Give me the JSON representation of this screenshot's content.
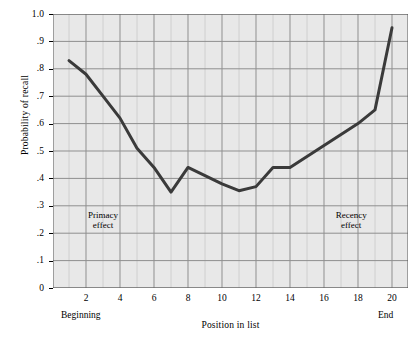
{
  "chart_data": {
    "type": "line",
    "title": "",
    "xlabel": "Position in list",
    "ylabel": "Probability of recall",
    "x": [
      1,
      2,
      3,
      4,
      5,
      6,
      7,
      8,
      9,
      10,
      11,
      12,
      13,
      14,
      15,
      16,
      17,
      18,
      19,
      20
    ],
    "values": [
      0.83,
      0.78,
      0.7,
      0.62,
      0.51,
      0.44,
      0.35,
      0.44,
      0.41,
      0.38,
      0.355,
      0.37,
      0.44,
      0.44,
      0.48,
      0.52,
      0.56,
      0.6,
      0.65,
      0.95
    ],
    "series": [
      {
        "name": "Probability of recall",
        "values": [
          0.83,
          0.78,
          0.7,
          0.62,
          0.51,
          0.44,
          0.35,
          0.44,
          0.41,
          0.38,
          0.355,
          0.37,
          0.44,
          0.44,
          0.48,
          0.52,
          0.56,
          0.6,
          0.65,
          0.95
        ]
      }
    ],
    "xlim": [
      1,
      20
    ],
    "ylim": [
      0,
      1.0
    ],
    "grid": true,
    "legend": "none",
    "line_color": "#3a3a3a",
    "plot_background": "#e8e8e8",
    "grid_color": "#9a9a9a",
    "y_ticks": [
      "0",
      ".1",
      ".2",
      ".3",
      ".4",
      ".5",
      ".6",
      ".7",
      ".8",
      ".9",
      "1.0"
    ],
    "y_tick_values": [
      0,
      0.1,
      0.2,
      0.3,
      0.4,
      0.5,
      0.6,
      0.7,
      0.8,
      0.9,
      1.0
    ],
    "x_ticks": [
      "2",
      "4",
      "6",
      "8",
      "10",
      "12",
      "14",
      "16",
      "18",
      "20"
    ],
    "x_tick_values": [
      2,
      4,
      6,
      8,
      10,
      12,
      14,
      16,
      18,
      20
    ],
    "annotations": [
      {
        "text_line1": "Primacy",
        "text_line2": "effect",
        "x": 3.0,
        "y": 0.245
      },
      {
        "text_line1": "Recency",
        "text_line2": "effect",
        "x": 17.6,
        "y": 0.245
      }
    ],
    "axis_end_labels": [
      {
        "text": "Beginning",
        "x": 2
      },
      {
        "text": "End",
        "x": 20
      }
    ]
  }
}
